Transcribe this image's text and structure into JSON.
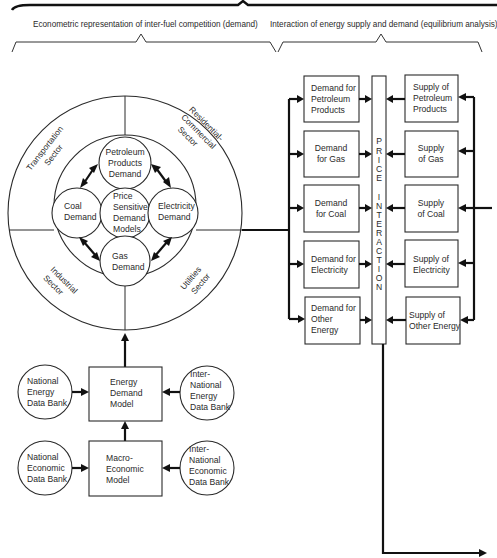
{
  "headers": {
    "left": "Econometric representation of inter-fuel competition (demand)",
    "right": "Interaction of energy supply and demand (equilibrium analysis)"
  },
  "sectors": {
    "transportation": [
      "Transportation",
      "Sector"
    ],
    "residential": [
      "Residential-",
      "Commercial",
      "Sector"
    ],
    "industrial": [
      "Industrial",
      "Sector"
    ],
    "utilities": [
      "Utilities",
      "Sector"
    ]
  },
  "inner_circles": {
    "petroleum": [
      "Petroleum",
      "Products",
      "Demand"
    ],
    "coal": [
      "Coal",
      "Demand"
    ],
    "center": [
      "Price",
      "Sensitive",
      "Demand",
      "Models"
    ],
    "electricity": [
      "Electricity",
      "Demand"
    ],
    "gas": [
      "Gas",
      "Demand"
    ]
  },
  "demand_boxes": [
    [
      "Demand for",
      "Petroleum",
      "Products"
    ],
    [
      "Demand",
      "for Gas"
    ],
    [
      "Demand",
      "for Coal"
    ],
    [
      "Demand for",
      "Electricity"
    ],
    [
      "Demand for",
      "Other",
      "Energy"
    ]
  ],
  "price_interaction": [
    "P",
    "R",
    "I",
    "C",
    "E",
    "",
    "I",
    "N",
    "T",
    "E",
    "R",
    "A",
    "C",
    "T",
    "I",
    "O",
    "N"
  ],
  "supply_boxes": [
    [
      "Supply of",
      "Petroleum",
      "Products"
    ],
    [
      "Supply",
      "of Gas"
    ],
    [
      "Supply",
      "of Coal"
    ],
    [
      "Supply of",
      "Electricity"
    ],
    [
      "Supply of",
      "Other Energy"
    ]
  ],
  "models": {
    "energy_demand": [
      "Energy",
      "Demand",
      "Model"
    ],
    "macro_economic": [
      "Macro-",
      "Economic",
      "Model"
    ]
  },
  "data_banks": {
    "national_energy": [
      "National",
      "Energy",
      "Data Bank"
    ],
    "international_energy": [
      "Inter-",
      "National",
      "Energy",
      "Data Bank"
    ],
    "national_economic": [
      "National",
      "Economic",
      "Data Bank"
    ],
    "international_economic": [
      "Inter-",
      "National",
      "Economic",
      "Data Bank"
    ]
  }
}
